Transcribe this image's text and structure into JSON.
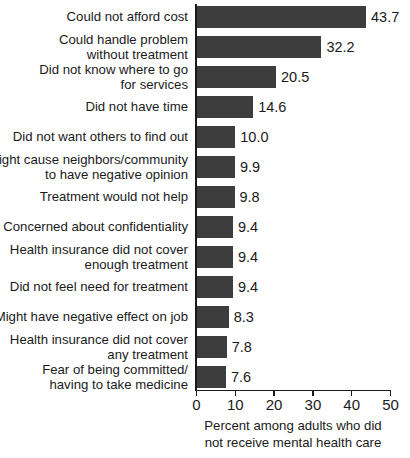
{
  "chart_data": {
    "type": "bar",
    "orientation": "horizontal",
    "title": "",
    "subtitle": "",
    "xlabel": "Percent among adults who did not receive mental health care",
    "ylabel": "",
    "xlim": [
      0,
      50
    ],
    "xticks": [
      0,
      10,
      20,
      30,
      40,
      50
    ],
    "xtick_labels": [
      "0",
      "10",
      "20",
      "30",
      "40",
      "50"
    ],
    "grid": false,
    "legend": null,
    "bar_color": "#3d3d3d",
    "background_color": "#ffffff",
    "axis_color": "#1a1a1a",
    "categories": [
      "Could not afford cost",
      "Could handle problem without treatment",
      "Did not know where to go for services",
      "Did not have time",
      "Did not want others to find out",
      "Might cause neighbors/community to have negative opinion",
      "Treatment would not help",
      "Concerned about confidentiality",
      "Health insurance did not cover enough treatment",
      "Did not feel need for treatment",
      "Might have negative effect on job",
      "Health insurance did not cover any treatment",
      "Fear of being committed/ having to take medicine"
    ],
    "values": [
      43.7,
      32.2,
      20.5,
      14.6,
      10.0,
      9.9,
      9.8,
      9.4,
      9.4,
      9.4,
      8.3,
      7.8,
      7.6
    ],
    "value_labels": [
      "43.7",
      "32.2",
      "20.5",
      "14.6",
      "10.0",
      "9.9",
      "9.8",
      "9.4",
      "9.4",
      "9.4",
      "8.3",
      "7.8",
      "7.6"
    ]
  },
  "rows": [
    {
      "label_lines": [
        "Could not afford cost"
      ],
      "value": 43.7,
      "value_label": "43.7"
    },
    {
      "label_lines": [
        "Could handle problem",
        "without treatment"
      ],
      "value": 32.2,
      "value_label": "32.2"
    },
    {
      "label_lines": [
        "Did not know where to go",
        "for services"
      ],
      "value": 20.5,
      "value_label": "20.5"
    },
    {
      "label_lines": [
        "Did not have time"
      ],
      "value": 14.6,
      "value_label": "14.6"
    },
    {
      "label_lines": [
        "Did not want others to find out"
      ],
      "value": 10.0,
      "value_label": "10.0"
    },
    {
      "label_lines": [
        "Might cause neighbors/community",
        "to have negative opinion"
      ],
      "value": 9.9,
      "value_label": "9.9"
    },
    {
      "label_lines": [
        "Treatment would not help"
      ],
      "value": 9.8,
      "value_label": "9.8"
    },
    {
      "label_lines": [
        "Concerned about confidentiality"
      ],
      "value": 9.4,
      "value_label": "9.4"
    },
    {
      "label_lines": [
        "Health insurance did not cover",
        "enough treatment"
      ],
      "value": 9.4,
      "value_label": "9.4"
    },
    {
      "label_lines": [
        "Did not feel need for treatment"
      ],
      "value": 9.4,
      "value_label": "9.4"
    },
    {
      "label_lines": [
        "Might have negative effect on job"
      ],
      "value": 8.3,
      "value_label": "8.3"
    },
    {
      "label_lines": [
        "Health insurance did not cover",
        "any treatment"
      ],
      "value": 7.8,
      "value_label": "7.8"
    },
    {
      "label_lines": [
        "Fear of being committed/",
        "having to take medicine"
      ],
      "value": 7.6,
      "value_label": "7.6"
    }
  ],
  "axis_caption_lines": [
    "Percent among adults who did",
    "not receive mental health care"
  ]
}
